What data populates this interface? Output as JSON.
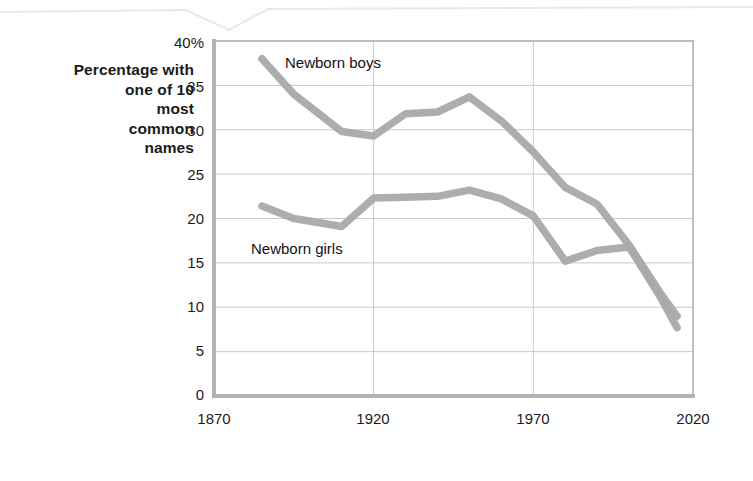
{
  "figure": {
    "background": "#ffffff",
    "line_color": "#a9a9a9",
    "axis_color": "#b3b3b3",
    "grid_color": "#c9c9c9",
    "text_color": "#1b1b1b"
  },
  "axis_title_y": {
    "lines": [
      "Percentage with",
      "one of 10",
      "most",
      "common",
      "names"
    ]
  },
  "axis_title_x": {
    "label": "Year"
  },
  "y_ticks": [
    {
      "label": "40%",
      "value": 40
    },
    {
      "label": "35",
      "value": 35
    },
    {
      "label": "30",
      "value": 30
    },
    {
      "label": "25",
      "value": 25
    },
    {
      "label": "20",
      "value": 20
    },
    {
      "label": "15",
      "value": 15
    },
    {
      "label": "10",
      "value": 10
    },
    {
      "label": "5",
      "value": 5
    },
    {
      "label": "0",
      "value": 0
    }
  ],
  "x_ticks": [
    {
      "label": "1870",
      "value": 1870
    },
    {
      "label": "1920",
      "value": 1920
    },
    {
      "label": "1970",
      "value": 1970
    },
    {
      "label": "2020",
      "value": 2020
    }
  ],
  "series_labels": {
    "boys": "Newborn boys",
    "girls": "Newborn girls"
  },
  "chart_data": {
    "type": "line",
    "title": "",
    "subtitle": "",
    "xlabel": "Year",
    "ylabel": "Percentage with one of 10 most common names",
    "xlim": [
      1870,
      2020
    ],
    "ylim": [
      0,
      40
    ],
    "xticks": [
      1870,
      1920,
      1970,
      2020
    ],
    "yticks": [
      0,
      5,
      10,
      15,
      20,
      25,
      30,
      35,
      40
    ],
    "grid": true,
    "grid_axis": "both",
    "legend": "inline-annotations",
    "annotations": [
      {
        "text": "Newborn boys",
        "x": 1905,
        "y": 37.4
      },
      {
        "text": "Newborn girls",
        "x": 1892,
        "y": 16.8
      }
    ],
    "series": [
      {
        "name": "Newborn boys",
        "color": "#a9a9a9",
        "x": [
          1885,
          1895,
          1910,
          1920,
          1930,
          1940,
          1950,
          1960,
          1970,
          1980,
          1990,
          2000,
          2010,
          2015
        ],
        "y": [
          38.0,
          34.0,
          29.8,
          29.3,
          31.8,
          32.0,
          33.7,
          31.0,
          27.5,
          23.5,
          21.6,
          17.0,
          11.5,
          9.0
        ]
      },
      {
        "name": "Newborn girls",
        "color": "#a9a9a9",
        "x": [
          1885,
          1895,
          1910,
          1920,
          1930,
          1940,
          1950,
          1960,
          1970,
          1980,
          1990,
          2000,
          2010,
          2015
        ],
        "y": [
          21.4,
          20.0,
          19.1,
          22.3,
          22.4,
          22.5,
          23.2,
          22.2,
          20.3,
          15.2,
          16.4,
          16.8,
          11.0,
          7.7
        ]
      }
    ]
  }
}
